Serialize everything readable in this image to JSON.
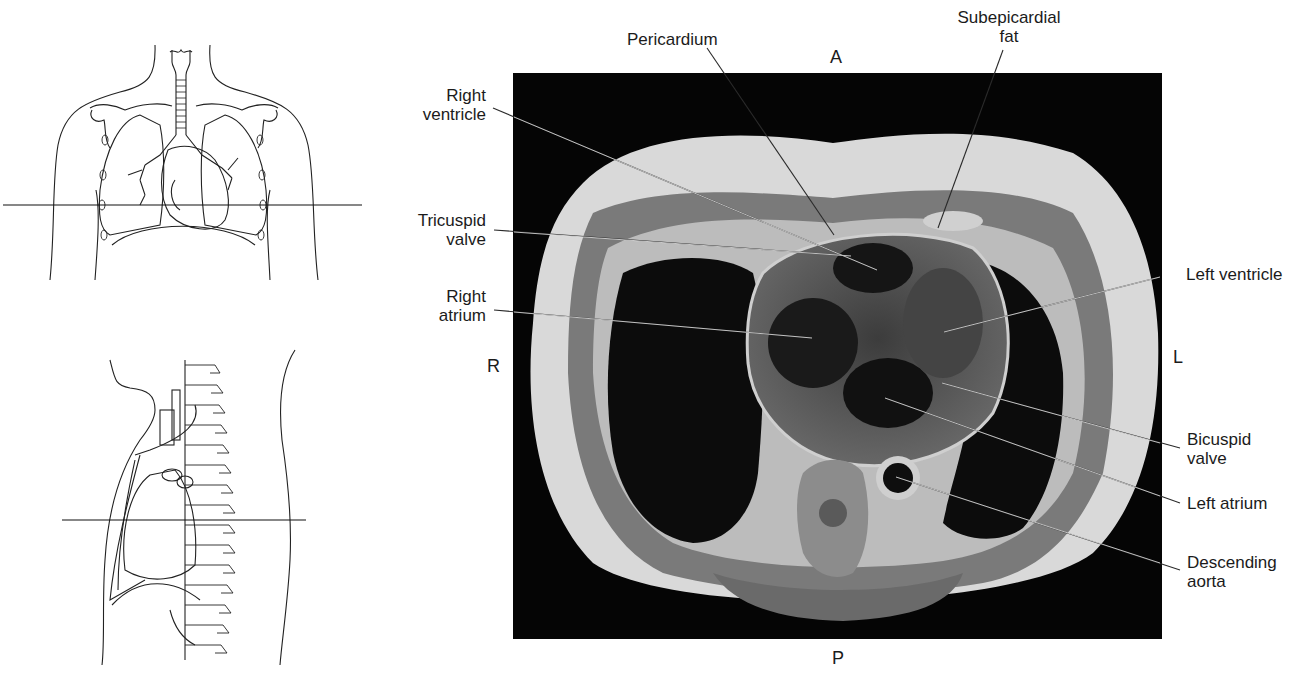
{
  "figure": {
    "type": "MRI axial section of the thorax with anatomical orientation drawings",
    "orientation": {
      "anterior": "A",
      "posterior": "P",
      "right": "R",
      "left": "L"
    },
    "labels": [
      {
        "id": "pericardium",
        "text": "Pericardium"
      },
      {
        "id": "subepicardial-fat",
        "text": "Subepicardial\nfat"
      },
      {
        "id": "right-ventricle",
        "text": "Right\nventricle"
      },
      {
        "id": "tricuspid-valve",
        "text": "Tricuspid\nvalve"
      },
      {
        "id": "right-atrium",
        "text": "Right\natrium"
      },
      {
        "id": "left-ventricle",
        "text": "Left ventricle"
      },
      {
        "id": "bicuspid-valve",
        "text": "Bicuspid\nvalve"
      },
      {
        "id": "left-atrium",
        "text": "Left atrium"
      },
      {
        "id": "descending-aorta",
        "text": "Descending\naorta"
      }
    ],
    "reference_drawings": [
      {
        "id": "anterior-view",
        "description": "Frontal torso outline with lungs, trachea and heart; horizontal line marks slice level"
      },
      {
        "id": "sagittal-view",
        "description": "Lateral torso outline with spine and heart; horizontal line marks slice level"
      }
    ]
  }
}
